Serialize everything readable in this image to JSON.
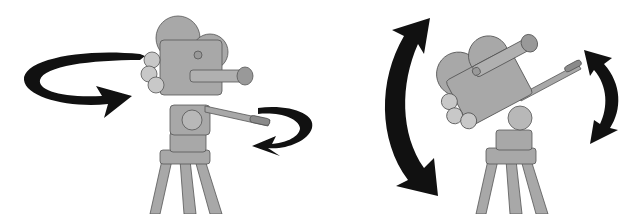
{
  "figure": {
    "colors": {
      "background": "#ffffff",
      "camera_fill": "#a8a8a8",
      "camera_dark": "#8a8a8a",
      "camera_light": "#c8c8c8",
      "outline": "#555555",
      "arrow": "#111111"
    },
    "panels": [
      {
        "id": "pan",
        "motion": "horizontal rotation (pan)"
      },
      {
        "id": "tilt",
        "motion": "vertical rotation (tilt)"
      }
    ]
  }
}
